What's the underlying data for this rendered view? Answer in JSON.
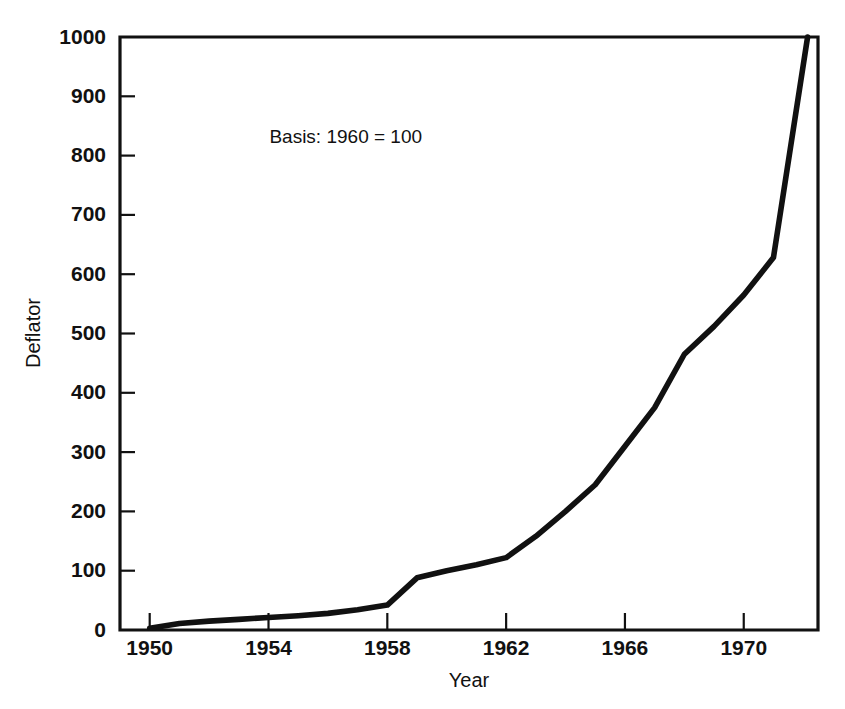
{
  "chart_data": {
    "type": "line",
    "title": "",
    "xlabel": "Year",
    "ylabel": "Deflator",
    "xlim": [
      1949,
      1972.5
    ],
    "ylim": [
      0,
      1000
    ],
    "grid": false,
    "legend": null,
    "annotations": [
      {
        "text": "Basis: 1960 = 100",
        "x": 1956.6,
        "y": 830
      }
    ],
    "x_ticks": [
      1950,
      1954,
      1958,
      1962,
      1966,
      1970
    ],
    "x_tick_labels": [
      "1950",
      "1954",
      "1958",
      "1962",
      "1966",
      "1970"
    ],
    "y_ticks": [
      0,
      100,
      200,
      300,
      400,
      500,
      600,
      700,
      800,
      900,
      1000
    ],
    "y_tick_labels": [
      "0",
      "100",
      "200",
      "300",
      "400",
      "500",
      "600",
      "700",
      "800",
      "900",
      "1000"
    ],
    "series": [
      {
        "name": "Deflator",
        "color": "#111111",
        "x": [
          1950,
          1951,
          1952,
          1953,
          1954,
          1955,
          1956,
          1957,
          1958,
          1959,
          1960,
          1961,
          1962,
          1963,
          1964,
          1965,
          1966,
          1967,
          1968,
          1969,
          1970,
          1971.15
        ],
        "values": [
          3,
          10,
          14,
          17,
          20,
          23,
          27,
          33,
          42,
          88,
          100,
          107,
          118,
          150,
          190,
          232,
          300,
          370,
          465,
          510,
          565,
          628
        ]
      }
    ],
    "series_corrected": {
      "name": "Deflator",
      "points": [
        [
          1950,
          3
        ],
        [
          1951,
          11
        ],
        [
          1952,
          15
        ],
        [
          1953,
          18
        ],
        [
          1954,
          21
        ],
        [
          1955,
          24
        ],
        [
          1956,
          28
        ],
        [
          1957,
          34
        ],
        [
          1958,
          42
        ],
        [
          1959,
          88
        ],
        [
          1960,
          100
        ],
        [
          1961,
          110
        ],
        [
          1962,
          122
        ],
        [
          1963,
          158
        ],
        [
          1964,
          200
        ],
        [
          1965,
          245
        ],
        [
          1966,
          310
        ],
        [
          1967,
          375
        ],
        [
          1968,
          465
        ],
        [
          1969,
          512
        ],
        [
          1970,
          565
        ],
        [
          1971,
          628
        ],
        [
          1972.15,
          1000
        ]
      ]
    }
  }
}
